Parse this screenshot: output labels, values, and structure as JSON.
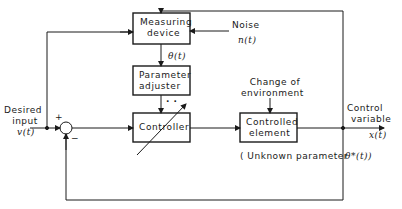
{
  "diagram": {
    "type": "adaptive-control-block-diagram",
    "blocks": {
      "measuring_device": [
        "Measuring",
        "device"
      ],
      "parameter_adjuster": [
        "Parameter",
        "adjuster"
      ],
      "controller": "Controller",
      "controlled_element": [
        "Controlled",
        "element"
      ]
    },
    "signals": {
      "noise_label": "Noise",
      "noise_symbol": "n(t)",
      "theta": "θ(t)",
      "desired_input": [
        "Desired",
        "input"
      ],
      "desired_symbol": "v(t)",
      "control_variable": [
        "Control",
        "variable"
      ],
      "control_symbol": "x(t)",
      "environment": [
        "Change of",
        "environment"
      ],
      "unknown_param": "( Unknown parameter",
      "unknown_symbol": "θ*(t))",
      "plus": "+",
      "minus": "−",
      "dots": "· ·"
    },
    "colors": {
      "line": "#1a1a1a",
      "background": "#ffffff"
    }
  }
}
